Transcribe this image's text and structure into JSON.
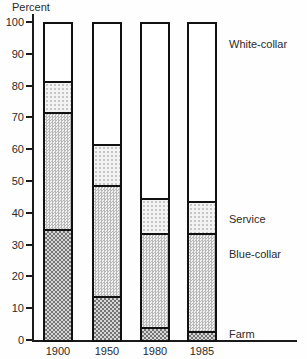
{
  "chart_data": {
    "type": "bar",
    "stacked": true,
    "title": "",
    "y_axis_title": "Percent",
    "xlabel": "",
    "ylabel": "Percent",
    "ylim": [
      0,
      100
    ],
    "y_ticks": [
      0,
      10,
      20,
      30,
      40,
      50,
      60,
      70,
      80,
      90,
      100
    ],
    "grid": false,
    "legend_position": "right-inline-labels",
    "categories": [
      "1900",
      "1950",
      "1980",
      "1985"
    ],
    "series": [
      {
        "name": "Farm",
        "values": [
          35,
          14,
          4,
          3
        ],
        "pattern": "dark-checker"
      },
      {
        "name": "Blue-collar",
        "values": [
          37,
          35,
          30,
          31
        ],
        "pattern": "medium-checker"
      },
      {
        "name": "Service",
        "values": [
          10,
          13,
          11,
          10
        ],
        "pattern": "light-dots"
      },
      {
        "name": "White-collar",
        "values": [
          18,
          38,
          55,
          56
        ],
        "pattern": "plain-white"
      }
    ],
    "series_labels": [
      {
        "text": "White-collar",
        "at_percent": 93
      },
      {
        "text": "Service",
        "at_percent": 38
      },
      {
        "text": "Blue-collar",
        "at_percent": 27
      },
      {
        "text": "Farm",
        "at_percent": 2
      }
    ],
    "colors": {
      "ink": "#1a1a1a",
      "background": "#fefefe"
    }
  }
}
